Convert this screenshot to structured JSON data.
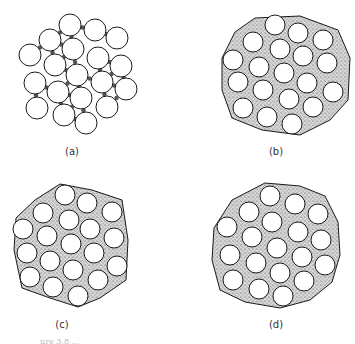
{
  "figure": {
    "colors": {
      "outline": "#1a1a1a",
      "particle_fill": "#ffffff",
      "matrix": "#9a9a9a",
      "background": "#ffffff"
    },
    "panels": [
      {
        "id": "a",
        "label": "(a)",
        "label_pos": [
          72,
          152
        ],
        "matrix": "none",
        "circles": [
          [
            70,
            25
          ],
          [
            95,
            30
          ],
          [
            117,
            38
          ],
          [
            50,
            40
          ],
          [
            73,
            49
          ],
          [
            30,
            55
          ],
          [
            55,
            65
          ],
          [
            98,
            58
          ],
          [
            121,
            66
          ],
          [
            77,
            75
          ],
          [
            35,
            83
          ],
          [
            58,
            92
          ],
          [
            102,
            82
          ],
          [
            126,
            89
          ],
          [
            81,
            98
          ],
          [
            37,
            108
          ],
          [
            64,
            115
          ],
          [
            86,
            123
          ],
          [
            107,
            107
          ]
        ],
        "radius": 11
      },
      {
        "id": "b",
        "label": "(b)",
        "label_pos": [
          276,
          152
        ],
        "matrix": "partial",
        "circles": [
          [
            275,
            25
          ],
          [
            298,
            33
          ],
          [
            323,
            40
          ],
          [
            253,
            42
          ],
          [
            280,
            49
          ],
          [
            233,
            60
          ],
          [
            259,
            67
          ],
          [
            303,
            56
          ],
          [
            327,
            63
          ],
          [
            284,
            73
          ],
          [
            238,
            82
          ],
          [
            263,
            90
          ],
          [
            307,
            83
          ],
          [
            333,
            92
          ],
          [
            289,
            99
          ],
          [
            243,
            108
          ],
          [
            267,
            117
          ],
          [
            292,
            124
          ],
          [
            313,
            107
          ]
        ],
        "radius": 10,
        "boundary": [
          [
            255,
            18
          ],
          [
            300,
            16
          ],
          [
            338,
            30
          ],
          [
            350,
            58
          ],
          [
            348,
            100
          ],
          [
            330,
            120
          ],
          [
            300,
            135
          ],
          [
            262,
            130
          ],
          [
            232,
            118
          ],
          [
            222,
            90
          ],
          [
            222,
            58
          ],
          [
            235,
            32
          ]
        ]
      },
      {
        "id": "c",
        "label": "(c)",
        "label_pos": [
          62,
          325
        ],
        "matrix": "full",
        "circles": [
          [
            65,
            195
          ],
          [
            87,
            203
          ],
          [
            112,
            212
          ],
          [
            43,
            213
          ],
          [
            69,
            220
          ],
          [
            23,
            229
          ],
          [
            47,
            236
          ],
          [
            90,
            229
          ],
          [
            114,
            238
          ],
          [
            71,
            244
          ],
          [
            27,
            253
          ],
          [
            50,
            261
          ],
          [
            94,
            253
          ],
          [
            117,
            266
          ],
          [
            73,
            270
          ],
          [
            30,
            277
          ],
          [
            53,
            287
          ],
          [
            78,
            296
          ],
          [
            98,
            280
          ]
        ],
        "radius": 10,
        "boundary": [
          [
            60,
            184
          ],
          [
            92,
            190
          ],
          [
            122,
            200
          ],
          [
            128,
            240
          ],
          [
            126,
            280
          ],
          [
            100,
            298
          ],
          [
            78,
            307
          ],
          [
            50,
            298
          ],
          [
            22,
            288
          ],
          [
            14,
            250
          ],
          [
            16,
            218
          ],
          [
            35,
            200
          ]
        ]
      },
      {
        "id": "d",
        "label": "(d)",
        "label_pos": [
          276,
          325
        ],
        "matrix": "full",
        "circles": [
          [
            270,
            196
          ],
          [
            295,
            204
          ],
          [
            318,
            214
          ],
          [
            249,
            212
          ],
          [
            272,
            222
          ],
          [
            227,
            227
          ],
          [
            252,
            237
          ],
          [
            298,
            232
          ],
          [
            321,
            240
          ],
          [
            277,
            248
          ],
          [
            230,
            255
          ],
          [
            256,
            263
          ],
          [
            302,
            257
          ],
          [
            325,
            265
          ],
          [
            280,
            273
          ],
          [
            233,
            280
          ],
          [
            259,
            289
          ],
          [
            283,
            296
          ],
          [
            304,
            281
          ]
        ],
        "radius": 10,
        "boundary": [
          [
            265,
            183
          ],
          [
            300,
            186
          ],
          [
            325,
            196
          ],
          [
            338,
            222
          ],
          [
            340,
            255
          ],
          [
            332,
            282
          ],
          [
            310,
            300
          ],
          [
            280,
            308
          ],
          [
            245,
            302
          ],
          [
            220,
            290
          ],
          [
            212,
            260
          ],
          [
            214,
            228
          ],
          [
            232,
            200
          ]
        ]
      }
    ],
    "caption_fragment": "ure 3.8 ..."
  }
}
